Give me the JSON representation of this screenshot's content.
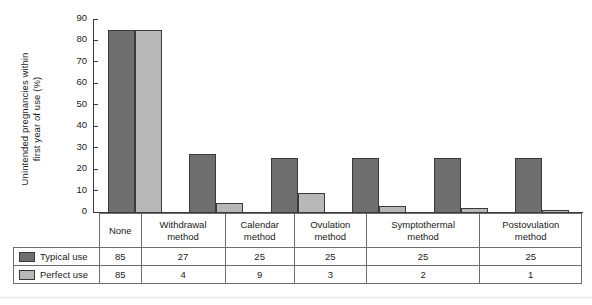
{
  "chart_data": {
    "type": "bar",
    "title": "",
    "xlabel": "",
    "ylabel": "Unintended pregnancies within first year of use (%)",
    "ylabel_line1": "Unintended pregnancies within",
    "ylabel_line2": "first year of use (%)",
    "ylim": [
      0,
      90
    ],
    "yticks": [
      90,
      80,
      70,
      60,
      50,
      40,
      30,
      20,
      10,
      0
    ],
    "grid": false,
    "legend_position": "table-left",
    "categories": [
      "None",
      "Withdrawal method",
      "Calendar method",
      "Ovulation method",
      "Symptothermal method",
      "Postovulation method"
    ],
    "category_lines": [
      [
        "None",
        ""
      ],
      [
        "Withdrawal",
        "method"
      ],
      [
        "Calendar",
        "method"
      ],
      [
        "Ovulation",
        "method"
      ],
      [
        "Symptothermal",
        "method"
      ],
      [
        "Postovulation",
        "method"
      ]
    ],
    "series": [
      {
        "name": "Typical use",
        "color": "#6e6e6e",
        "values": [
          85,
          27,
          25,
          25,
          25,
          25
        ]
      },
      {
        "name": "Perfect use",
        "color": "#b7b7b7",
        "values": [
          85,
          4,
          9,
          3,
          2,
          1
        ]
      }
    ]
  },
  "table": {
    "rows": [
      {
        "label": "Typical use",
        "swatch": "typical",
        "values": [
          "85",
          "27",
          "25",
          "25",
          "25",
          "25"
        ]
      },
      {
        "label": "Perfect use",
        "swatch": "perfect",
        "values": [
          "85",
          "4",
          "9",
          "3",
          "2",
          "1"
        ]
      }
    ]
  },
  "colors": {
    "typical": "#6e6e6e",
    "perfect": "#b7b7b7",
    "axis": "#3a3a3a",
    "grid_line": "#6d6d6d",
    "background": "#ffffff"
  }
}
